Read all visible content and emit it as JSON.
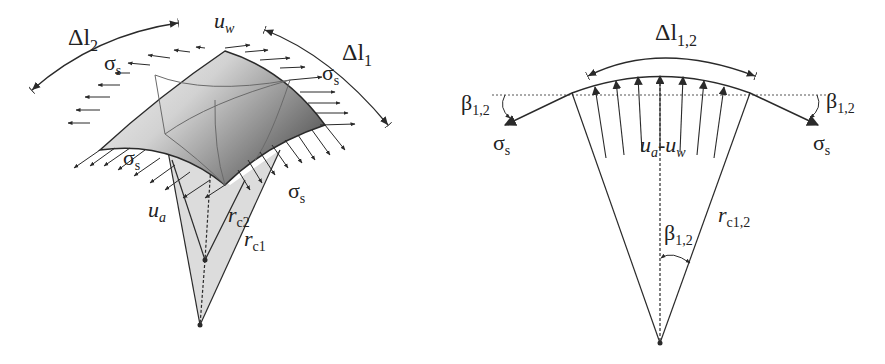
{
  "figure": {
    "left_panel": {
      "description": "3D doubly-curved membrane surface element under surface tension with pressure difference",
      "labels": {
        "dl2": "Δl",
        "dl2_sub": "2",
        "dl1": "Δl",
        "dl1_sub": "1",
        "uw": "u",
        "uw_sub": "w",
        "ua": "u",
        "ua_sub": "a",
        "sigma_s": "σ",
        "sigma_s_sub": "s",
        "rc2": "r",
        "rc2_sub": "c2",
        "rc1": "r",
        "rc1_sub": "c1"
      }
    },
    "right_panel": {
      "description": "2D cross-section showing force balance on curved interface",
      "labels": {
        "dl12": "Δl",
        "dl12_sub": "1,2",
        "beta": "β",
        "beta_sub": "1,2",
        "sigma_s": "σ",
        "sigma_s_sub": "s",
        "ua_uw": "u",
        "ua_uw_sub_a": "a",
        "ua_uw_dash": "-u",
        "ua_uw_sub_w": "w",
        "rc12": "r",
        "rc12_sub": "c1,2"
      }
    },
    "colors": {
      "line": "#2a2a2a",
      "surface_light": "#efefef",
      "surface_dark": "#6e6e6e",
      "cone_fill": "#dcdcdc"
    }
  }
}
